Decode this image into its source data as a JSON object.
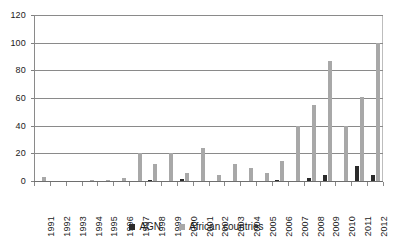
{
  "chart_data": {
    "type": "bar",
    "title": "",
    "subtitle": "",
    "xlabel": "",
    "ylabel": "",
    "categories": [
      "1991",
      "1992",
      "1993",
      "1994",
      "1995",
      "1996",
      "1997",
      "1998",
      "1999",
      "2000",
      "2001",
      "2002",
      "2003",
      "2004",
      "2005",
      "2006",
      "2007",
      "2008",
      "2009",
      "2010",
      "2011",
      "2012"
    ],
    "series": [
      {
        "name": "AGN",
        "color": "#2b2b2b",
        "values": [
          0,
          0,
          0,
          0,
          0,
          0,
          0,
          1,
          0,
          1.5,
          0,
          0,
          0,
          0,
          0,
          1,
          0,
          2,
          4.5,
          0,
          11,
          4
        ]
      },
      {
        "name": "African countries",
        "color": "#a8a8a8",
        "values": [
          3,
          0,
          0,
          0.5,
          1,
          2,
          20,
          12,
          20,
          6,
          24,
          4.5,
          12.5,
          9.5,
          5.5,
          14.5,
          40,
          55,
          86.5,
          40,
          61,
          100
        ]
      }
    ],
    "ylim": [
      0,
      120
    ],
    "yticks": [
      0,
      20,
      40,
      60,
      80,
      100,
      120
    ],
    "ytick_labels": [
      "0",
      "20",
      "40",
      "60",
      "80",
      "100",
      "120"
    ],
    "grid": "horizontal",
    "legend_position": "bottom",
    "legend_entries": [
      "AGN",
      "African countries"
    ]
  },
  "legend": {
    "items": [
      {
        "label": "AGN",
        "swatch": "agn"
      },
      {
        "label": "African countries",
        "swatch": "afr"
      }
    ]
  }
}
